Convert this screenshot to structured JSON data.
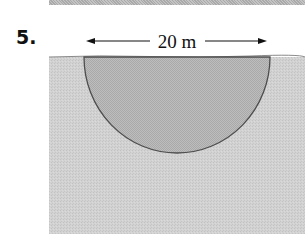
{
  "problem": {
    "number": "5."
  },
  "figure": {
    "type": "semicircular plate submerged in water",
    "dimension_label": "20 m",
    "dimension_value": 20,
    "dimension_unit": "m",
    "colors": {
      "water": "#cfcfcf",
      "plate": "#b9b9b9",
      "outline": "#555555",
      "top_strip": "#b5b5b5"
    }
  }
}
